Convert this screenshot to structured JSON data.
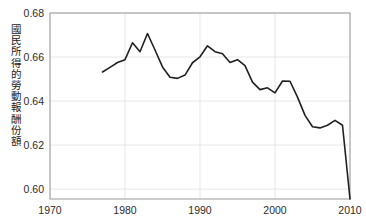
{
  "chart_data": {
    "type": "line",
    "title": "",
    "xlabel": "",
    "ylabel": "國民所得的勞動報酬份額",
    "xlim": [
      1970,
      2010
    ],
    "ylim": [
      0.595,
      0.68
    ],
    "ytick_labels": [
      "0.68",
      "0.66",
      "0.64",
      "0.62",
      "0.60"
    ],
    "ytick_values": [
      0.68,
      0.66,
      0.64,
      0.62,
      0.6
    ],
    "xtick_labels": [
      "1970",
      "1980",
      "1990",
      "2000",
      "2010"
    ],
    "xtick_values": [
      1970,
      1980,
      1990,
      2000,
      2010
    ],
    "grid": true,
    "legend": "none",
    "line_color": "#231f20",
    "series": [
      {
        "name": "勞動報酬份額",
        "x": [
          1977,
          1978,
          1979,
          1980,
          1981,
          1982,
          1983,
          1984,
          1985,
          1986,
          1987,
          1988,
          1989,
          1990,
          1991,
          1992,
          1993,
          1994,
          1995,
          1996,
          1997,
          1998,
          1999,
          2000,
          2001,
          2002,
          2003,
          2004,
          2005,
          2006,
          2007,
          2008,
          2009,
          2010
        ],
        "values": [
          0.6532,
          0.6553,
          0.6575,
          0.6588,
          0.6665,
          0.6624,
          0.6707,
          0.6632,
          0.6555,
          0.6508,
          0.6503,
          0.6518,
          0.6574,
          0.6601,
          0.6651,
          0.6624,
          0.6615,
          0.6575,
          0.6588,
          0.6561,
          0.6486,
          0.6452,
          0.646,
          0.6437,
          0.6491,
          0.649,
          0.6418,
          0.6335,
          0.6283,
          0.6278,
          0.629,
          0.6312,
          0.629,
          0.5955
        ]
      }
    ]
  },
  "axis": {
    "y_title": "國民所得的勞動報酬份額"
  }
}
